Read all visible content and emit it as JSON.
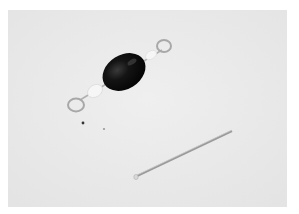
{
  "image": {
    "description": "Black oval bead on an eye pin with two wire loops, and a straight head pin, on a light gray surface",
    "colors": {
      "background": "#ffffff",
      "surface": "#ebebeb",
      "bead": "#141414",
      "wire": "#b8b8b8",
      "spacer": "#f4f4f4"
    },
    "objects": [
      {
        "name": "beaded-eye-pin",
        "label": "Black bead on eye pin"
      },
      {
        "name": "head-pin",
        "label": "Head pin"
      }
    ]
  }
}
